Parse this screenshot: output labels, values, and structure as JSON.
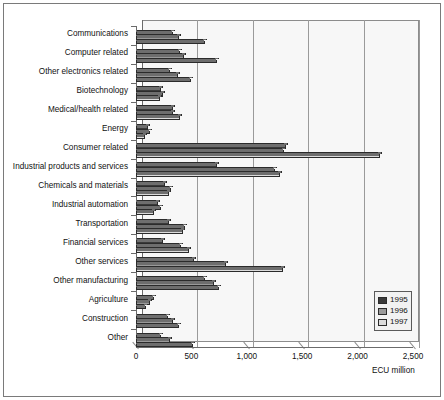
{
  "chart_data": {
    "type": "bar",
    "orientation": "horizontal",
    "title": "",
    "xlabel": "ECU million",
    "ylabel": "",
    "xlim": [
      0,
      2500
    ],
    "xticks": [
      0,
      500,
      1000,
      1500,
      2000,
      2500
    ],
    "xticklabels": [
      "0",
      "500",
      "1,000",
      "1,500",
      "2,000",
      "2,500"
    ],
    "grid": true,
    "legend_position": "bottom-right",
    "categories": [
      "Communications",
      "Computer related",
      "Other electronics related",
      "Biotechnology",
      "Medical/health related",
      "Energy",
      "Consumer related",
      "Industrial products and services",
      "Chemicals and materials",
      "Industrial automation",
      "Transportation",
      "Financial services",
      "Other services",
      "Other manufacturing",
      "Agriculture",
      "Construction",
      "Other"
    ],
    "series": [
      {
        "name": "1995",
        "color": "#3a3a3a",
        "values": [
          330,
          400,
          310,
          230,
          330,
          110,
          1350,
          730,
          260,
          200,
          300,
          245,
          520,
          620,
          165,
          290,
          230
        ]
      },
      {
        "name": "1996",
        "color": "#9a9a9a",
        "values": [
          390,
          435,
          380,
          240,
          335,
          130,
          1340,
          1250,
          320,
          230,
          445,
          410,
          810,
          700,
          125,
          330,
          310
        ]
      },
      {
        "name": "1997",
        "color": "#dcdcdc",
        "values": [
          620,
          730,
          500,
          215,
          400,
          80,
          2200,
          1300,
          300,
          165,
          420,
          480,
          1330,
          745,
          90,
          390,
          510
        ]
      }
    ]
  },
  "legend": {
    "entries": [
      {
        "label": "1995",
        "color": "#3a3a3a"
      },
      {
        "label": "1996",
        "color": "#9a9a9a"
      },
      {
        "label": "1997",
        "color": "#dcdcdc"
      }
    ]
  },
  "axis": {
    "unit_label": "ECU million"
  }
}
